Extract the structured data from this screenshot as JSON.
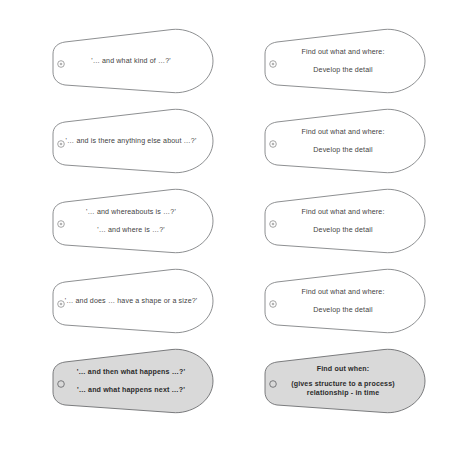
{
  "diagram": {
    "icon_name": "hub-anchor-icon",
    "colors": {
      "outline": "#808285",
      "shape_fill": "#ffffff",
      "shaded_fill": "#d9d9d9",
      "text": "#3f3f3f",
      "background": "#ffffff"
    },
    "left_column": [
      {
        "id": "left-1",
        "shaded": false,
        "layout": "spaced",
        "lines": [
          "'… and what kind of …?'"
        ]
      },
      {
        "id": "left-2",
        "shaded": false,
        "layout": "spaced",
        "lines": [
          "'… and is there anything else about …?'"
        ]
      },
      {
        "id": "left-3",
        "shaded": false,
        "layout": "spaced",
        "lines": [
          "'… and whereabouts is …?'",
          "'… and where is …?'"
        ]
      },
      {
        "id": "left-4",
        "shaded": false,
        "layout": "spaced",
        "lines": [
          "'… and does … have a shape or a size?'"
        ]
      },
      {
        "id": "left-5",
        "shaded": true,
        "layout": "spaced",
        "lines": [
          "'… and then what happens …?'",
          "'… and what happens next …?'"
        ]
      }
    ],
    "right_column": [
      {
        "id": "right-1",
        "shaded": false,
        "layout": "spaced",
        "lines": [
          "Find out what and where:",
          "Develop the detail"
        ]
      },
      {
        "id": "right-2",
        "shaded": false,
        "layout": "spaced",
        "lines": [
          "Find out what and where:",
          "Develop the detail"
        ]
      },
      {
        "id": "right-3",
        "shaded": false,
        "layout": "spaced",
        "lines": [
          "Find out what and where:",
          "Develop the detail"
        ]
      },
      {
        "id": "right-4",
        "shaded": false,
        "layout": "spaced",
        "lines": [
          "Find out what and where:",
          "Develop the detail"
        ]
      },
      {
        "id": "right-5",
        "shaded": true,
        "layout": "titled",
        "title": "Find out when:",
        "lines": [
          "(gives structure to a process)",
          "relationship - in time"
        ]
      }
    ]
  }
}
